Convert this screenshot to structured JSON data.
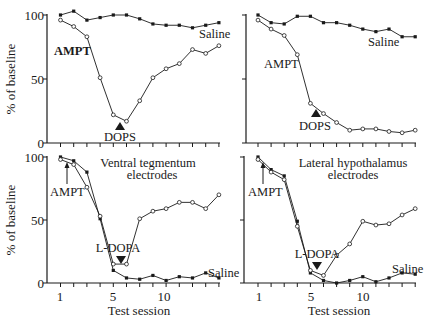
{
  "figure": {
    "ylabel": "% of baseline",
    "xlabel": "Test session",
    "yticks": [
      "100",
      "50",
      "0"
    ],
    "xticks": [
      "1",
      "5",
      "10"
    ]
  },
  "colors": {
    "ink": "#1a1a1a",
    "open_marker": "#ffffff"
  },
  "chart_data": [
    {
      "type": "line",
      "panel": "top-left",
      "title": "",
      "xlabel": "",
      "ylabel": "% of baseline",
      "ylim": [
        0,
        100
      ],
      "x": [
        1,
        2,
        3,
        4,
        5,
        6,
        7,
        8,
        9,
        10,
        11,
        12,
        13
      ],
      "series": [
        {
          "name": "Saline",
          "marker": "filled",
          "values": [
            100,
            103,
            96,
            98,
            100,
            100,
            97,
            93,
            92,
            92,
            90,
            92,
            94
          ]
        },
        {
          "name": "AMPT + DOPS",
          "marker": "open",
          "values": [
            96,
            91,
            83,
            51,
            22,
            17,
            33,
            51,
            58,
            62,
            73,
            70,
            76
          ]
        }
      ],
      "annotations": [
        {
          "text": "AMPT",
          "near_x": 2
        },
        {
          "text": "DOPS",
          "near_x": 6,
          "arrow": "up-triangle"
        },
        {
          "text": "Saline",
          "near_x": 12
        }
      ]
    },
    {
      "type": "line",
      "panel": "top-right",
      "title": "",
      "xlabel": "",
      "ylabel": "",
      "ylim": [
        0,
        100
      ],
      "x": [
        1,
        2,
        3,
        4,
        5,
        6,
        7,
        8,
        9,
        10,
        11,
        12,
        13
      ],
      "series": [
        {
          "name": "Saline",
          "marker": "filled",
          "values": [
            100,
            94,
            93,
            99,
            99,
            94,
            94,
            92,
            89,
            87,
            89,
            83,
            83
          ]
        },
        {
          "name": "AMPT + DOPS",
          "marker": "open",
          "values": [
            96,
            89,
            84,
            69,
            31,
            23,
            16,
            10,
            11,
            11,
            9,
            8,
            10
          ]
        }
      ],
      "annotations": [
        {
          "text": "AMPT",
          "near_x": 4
        },
        {
          "text": "DOPS",
          "near_x": 6,
          "arrow": "up-triangle"
        },
        {
          "text": "Saline",
          "near_x": 10
        }
      ]
    },
    {
      "type": "line",
      "panel": "bottom-left",
      "title": "Ventral tegmentum electrodes",
      "xlabel": "Test session",
      "ylabel": "% of baseline",
      "ylim": [
        0,
        100
      ],
      "x": [
        1,
        2,
        3,
        4,
        5,
        6,
        7,
        8,
        9,
        10,
        11,
        12,
        13
      ],
      "series": [
        {
          "name": "Saline",
          "marker": "filled",
          "values": [
            100,
            97,
            88,
            51,
            10,
            4,
            3,
            6,
            2,
            5,
            4,
            8,
            4
          ]
        },
        {
          "name": "AMPT + L-DOPA",
          "marker": "open",
          "values": [
            98,
            94,
            76,
            53,
            15,
            15,
            51,
            57,
            59,
            64,
            64,
            59,
            70
          ]
        }
      ],
      "annotations": [
        {
          "text": "AMPT",
          "near_x": 1,
          "arrow": "up-arrow"
        },
        {
          "text": "L-DOPA",
          "near_x": 6,
          "arrow": "down-triangle"
        },
        {
          "text": "Saline",
          "near_x": 13
        }
      ]
    },
    {
      "type": "line",
      "panel": "bottom-right",
      "title": "Lateral hypothalamus electrodes",
      "xlabel": "Test session",
      "ylabel": "",
      "ylim": [
        0,
        100
      ],
      "x": [
        1,
        2,
        3,
        4,
        5,
        6,
        7,
        8,
        9,
        10,
        11,
        12,
        13
      ],
      "series": [
        {
          "name": "Saline",
          "marker": "filled",
          "values": [
            100,
            90,
            85,
            49,
            8,
            2,
            0,
            2,
            5,
            1,
            4,
            8,
            7
          ]
        },
        {
          "name": "AMPT + L-DOPA",
          "marker": "open",
          "values": [
            98,
            88,
            82,
            45,
            10,
            6,
            22,
            31,
            49,
            46,
            47,
            54,
            59
          ]
        }
      ],
      "annotations": [
        {
          "text": "AMPT",
          "near_x": 1,
          "arrow": "up-arrow"
        },
        {
          "text": "L-DOPA",
          "near_x": 6,
          "arrow": "down-triangle"
        },
        {
          "text": "Saline",
          "near_x": 12
        }
      ]
    }
  ],
  "panels_text": {
    "tl": {
      "ampt": "AMPT",
      "drug": "DOPS",
      "saline": "Saline"
    },
    "tr": {
      "ampt": "AMPT",
      "drug": "DOPS",
      "saline": "Saline"
    },
    "bl": {
      "title1": "Ventral tegmentum",
      "title2": "electrodes",
      "ampt": "AMPT",
      "drug": "L-DOPA",
      "saline": "Saline"
    },
    "br": {
      "title1": "Lateral hypothalamus",
      "title2": "electrodes",
      "ampt": "AMPT",
      "drug": "L-DOPA",
      "saline": "Saline"
    }
  }
}
